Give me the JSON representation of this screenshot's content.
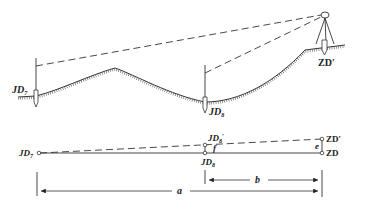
{
  "diagram": {
    "type": "surveying-profile",
    "top_view": {
      "labels": {
        "jd_left": {
          "main": "JD",
          "sub": "7"
        },
        "jd_mid": {
          "main": "JD",
          "sub": "8"
        },
        "zd_prime": "ZD′"
      }
    },
    "bottom_view": {
      "labels": {
        "jd_left": {
          "main": "JD",
          "sub": "7"
        },
        "jd_mid": {
          "main": "JD",
          "sub": "8"
        },
        "jd_mid_prime": {
          "main": "JD",
          "sub": "8",
          "prime": "′"
        },
        "zd_prime": "ZD′",
        "zd": "ZD",
        "e": "e",
        "f": "f"
      },
      "dimensions": {
        "a": "a",
        "b": "b"
      }
    },
    "colors": {
      "line": "#222222",
      "background": "#ffffff"
    }
  }
}
